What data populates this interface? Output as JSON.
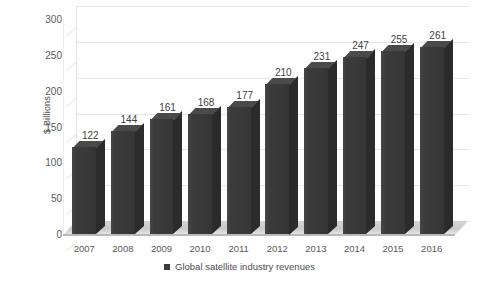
{
  "chart_data": {
    "type": "bar",
    "title": "",
    "subtitle": "",
    "xlabel": "",
    "ylabel": "$ Billions",
    "categories": [
      "2007",
      "2008",
      "2009",
      "2010",
      "2011",
      "2012",
      "2013",
      "2014",
      "2015",
      "2016"
    ],
    "values": [
      122,
      144,
      161,
      168,
      177,
      210,
      231,
      247,
      255,
      261
    ],
    "series": [
      {
        "name": "Global satellite industry revenues",
        "values": [
          122,
          144,
          161,
          168,
          177,
          210,
          231,
          247,
          255,
          261
        ]
      }
    ],
    "ylim": [
      0,
      300
    ],
    "ytick_labels": [
      "0",
      "50",
      "100",
      "150",
      "200",
      "250",
      "300"
    ],
    "ytick_values": [
      0,
      50,
      100,
      150,
      200,
      250,
      300
    ],
    "grid": true,
    "legend_position": "bottom",
    "data_labels": true,
    "style": "3d-column",
    "bar_color": "#3b3b3b",
    "gridline_color": "#e6e6e6",
    "text_color": "#595959"
  },
  "legend": {
    "entries": [
      {
        "label": "Global satellite industry revenues",
        "color": "#3b3b3b"
      }
    ]
  },
  "axis": {
    "y_title": "$ Billions"
  }
}
